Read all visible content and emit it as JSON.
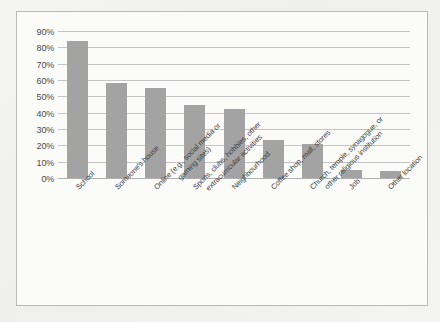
{
  "chart_data": {
    "type": "bar",
    "title": "",
    "subtitle": "",
    "xlabel": "",
    "ylabel": "",
    "ylim": [
      0,
      90
    ],
    "grid": true,
    "legend": "none",
    "orientation": "vertical",
    "bar_color": "#a3a3a3",
    "gridline_color": "#c4c4c4",
    "frame_color": "#b9b9b9",
    "background_color": "#fbfbfa",
    "y_ticks": [
      "0%",
      "10%",
      "20%",
      "30%",
      "40%",
      "50%",
      "60%",
      "70%",
      "80%",
      "90%"
    ],
    "y_tick_values": [
      0,
      10,
      20,
      30,
      40,
      50,
      60,
      70,
      80,
      90
    ],
    "categories": [
      "School",
      "Someone's house",
      "Online (e.g., social media or\ngaming sites)",
      "Sports, clubs, hobbies, other\nextracurricular activities",
      "Neighbourhood",
      "Coffee shop, mall, stores",
      "Church, temple, synagogue, or\nother religious institution",
      "Job",
      "Other location"
    ],
    "values": [
      84,
      58,
      55,
      45,
      42,
      23,
      21,
      5,
      4
    ]
  }
}
